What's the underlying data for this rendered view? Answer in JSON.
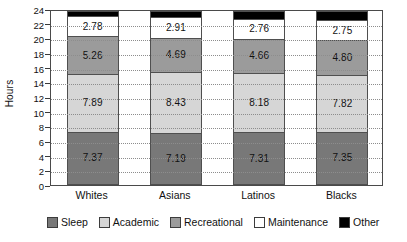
{
  "chart_data": {
    "type": "bar",
    "subtype": "stacked",
    "title": "",
    "xlabel": "",
    "ylabel": "Hours",
    "ylim": [
      0,
      24
    ],
    "ytick_step": 2,
    "yticks": [
      0,
      2,
      4,
      6,
      8,
      10,
      12,
      14,
      16,
      18,
      20,
      22,
      24
    ],
    "grid": true,
    "grid_style": "dotted-horizontal",
    "legend_position": "bottom",
    "categories": [
      "Whites",
      "Asians",
      "Latinos",
      "Blacks"
    ],
    "series": [
      {
        "name": "Sleep",
        "color": "#787878",
        "values": [
          7.37,
          7.19,
          7.31,
          7.35
        ],
        "labels": [
          "7.37",
          "7.19",
          "7.31",
          "7.35"
        ]
      },
      {
        "name": "Academic",
        "color": "#d6d6d6",
        "values": [
          7.89,
          8.43,
          8.18,
          7.82
        ],
        "labels": [
          "7.89",
          "8.43",
          "8.18",
          "7.82"
        ]
      },
      {
        "name": "Recreational",
        "color": "#9b9b9b",
        "values": [
          5.26,
          4.69,
          4.66,
          4.8
        ],
        "labels": [
          "5.26",
          "4.69",
          "4.66",
          "4.80"
        ]
      },
      {
        "name": "Maintenance",
        "color": "#ffffff",
        "values": [
          2.78,
          2.91,
          2.76,
          2.75
        ],
        "labels": [
          "2.78",
          "2.91",
          "2.76",
          "2.75"
        ]
      },
      {
        "name": "Other",
        "color": "#000000",
        "values": [
          0.7,
          0.78,
          1.09,
          1.28
        ],
        "labels": [
          "",
          "",
          "",
          ""
        ]
      }
    ]
  },
  "axis": {
    "y_title": "Hours",
    "y_tick_labels": [
      "24",
      "22",
      "20",
      "18",
      "16",
      "14",
      "12",
      "10",
      "8",
      "6",
      "4",
      "2",
      "0"
    ],
    "x_tick_labels": [
      "Whites",
      "Asians",
      "Latinos",
      "Blacks"
    ]
  },
  "legend": {
    "items": [
      {
        "label": "Sleep",
        "color": "#787878"
      },
      {
        "label": "Academic",
        "color": "#d6d6d6"
      },
      {
        "label": "Recreational",
        "color": "#9b9b9b"
      },
      {
        "label": "Maintenance",
        "color": "#ffffff"
      },
      {
        "label": "Other",
        "color": "#000000"
      }
    ]
  }
}
